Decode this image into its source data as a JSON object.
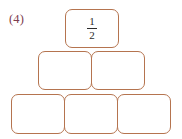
{
  "figure": {
    "problem_label": "(4)",
    "type": "number-pyramid",
    "border_color": "#b5744f",
    "label_color": "#7d3b4e",
    "background_color": "#ffffff",
    "rows": [
      {
        "row_index": 1,
        "position": "top",
        "cells": [
          {
            "id": "top-1",
            "value": "1/2",
            "numerator": "1",
            "denominator": "2",
            "filled": true
          }
        ]
      },
      {
        "row_index": 2,
        "position": "middle",
        "cells": [
          {
            "id": "mid-1",
            "value": "",
            "filled": false
          },
          {
            "id": "mid-2",
            "value": "",
            "filled": false
          }
        ]
      },
      {
        "row_index": 3,
        "position": "bottom",
        "cells": [
          {
            "id": "bot-1",
            "value": "",
            "filled": false
          },
          {
            "id": "bot-2",
            "value": "",
            "filled": false
          },
          {
            "id": "bot-3",
            "value": "",
            "filled": false
          }
        ]
      }
    ]
  }
}
